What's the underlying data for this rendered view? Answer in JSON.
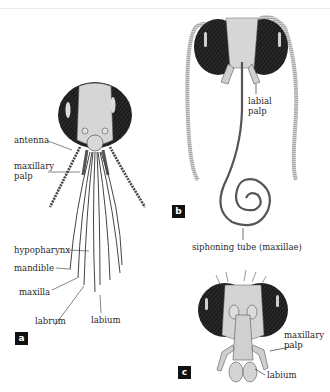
{
  "figure": {
    "panels": [
      {
        "id": "a",
        "tag": "a",
        "labels": {
          "antenna": "antenna",
          "maxillary_palp_1": "maxillary",
          "maxillary_palp_2": "palp",
          "hypopharynx": "hypopharynx",
          "mandible": "mandible",
          "maxilla": "maxilla",
          "labrum": "labrum",
          "labium": "labium"
        }
      },
      {
        "id": "b",
        "tag": "b",
        "labels": {
          "labial_palp_1": "labial",
          "labial_palp_2": "palp",
          "siphoning_tube": "siphoning tube (maxillae)"
        }
      },
      {
        "id": "c",
        "tag": "c",
        "labels": {
          "maxillary_palp_1": "maxillary",
          "maxillary_palp_2": "palp",
          "labium": "labium"
        }
      }
    ],
    "colors": {
      "eye": "#1e1e1e",
      "head": "#d4d4d4",
      "line": "#3a3a3a",
      "tag_bg": "#111111"
    }
  }
}
